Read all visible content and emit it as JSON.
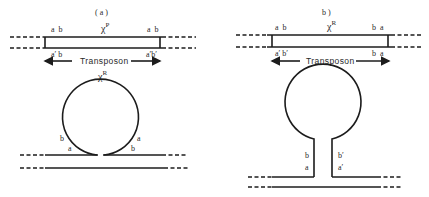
{
  "figure": {
    "panel_a": {
      "title": "( a )",
      "top_element_label": "χ",
      "top_element_superscript": "P",
      "top_left_upper": "a  b",
      "top_right_upper": "a  b",
      "top_left_lower": "a′ b",
      "top_right_lower": "a′b′",
      "transposon_label": "Transposon",
      "loop_label": "χ",
      "loop_superscript": "R",
      "loop_left_outer": "b",
      "loop_left_inner": "a",
      "loop_right_outer": "a",
      "loop_right_inner": "b"
    },
    "panel_b": {
      "title": "b )",
      "top_element_label": "χ",
      "top_element_superscript": "R",
      "top_left_upper": "a  b",
      "top_right_upper": "b  a",
      "top_left_lower": "a′ b′",
      "top_right_lower": "b  a",
      "transposon_label": "Transposon",
      "stem_left_upper": "b",
      "stem_left_lower": "a",
      "stem_right_upper": "b′",
      "stem_right_lower": "a′"
    }
  },
  "colors": {
    "line": "#1c1c1c",
    "text": "#2a2a2a",
    "background": "#ffffff"
  }
}
